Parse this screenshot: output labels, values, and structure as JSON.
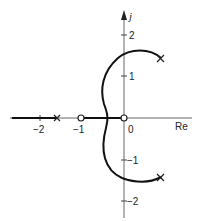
{
  "diagram": {
    "type": "root-locus",
    "axes": {
      "real_label": "Re",
      "imag_label": "j",
      "x_ticks": [
        {
          "value": -2,
          "label": "−2"
        },
        {
          "value": -1,
          "label": "−1"
        },
        {
          "value": 0,
          "label": "0"
        }
      ],
      "y_ticks": [
        {
          "value": 2,
          "label": "2"
        },
        {
          "value": 1,
          "label": "1"
        },
        {
          "value": -1,
          "label": "−1"
        },
        {
          "value": -2,
          "label": "−2"
        }
      ]
    },
    "poles": [
      {
        "re": -1.6,
        "im": 0
      },
      {
        "re": 0.9,
        "im": 1.3
      },
      {
        "re": 0.9,
        "im": -1.3
      }
    ],
    "zeros": [
      {
        "re": -1,
        "im": 0
      },
      {
        "re": 0,
        "im": 0
      }
    ],
    "colors": {
      "ink": "#222222",
      "axis": "#555555",
      "background": "#ffffff"
    }
  }
}
